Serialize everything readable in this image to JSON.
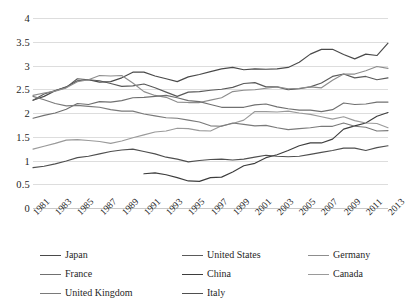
{
  "chart_data": {
    "type": "line",
    "title": "",
    "subtitle": "",
    "xlabel": "",
    "ylabel": "",
    "ylim": [
      0,
      4
    ],
    "yticks": [
      0,
      0.5,
      1,
      1.5,
      2,
      2.5,
      3,
      3.5,
      4
    ],
    "ytick_labels": [
      "0",
      "0.5",
      "1",
      "1.5",
      "2",
      "2.5",
      "3",
      "3.5",
      "4"
    ],
    "grid": true,
    "legend_position": "bottom",
    "x": [
      1981,
      1982,
      1983,
      1984,
      1985,
      1986,
      1987,
      1988,
      1989,
      1990,
      1991,
      1992,
      1993,
      1994,
      1995,
      1996,
      1997,
      1998,
      1999,
      2000,
      2001,
      2002,
      2003,
      2004,
      2005,
      2006,
      2007,
      2008,
      2009,
      2010,
      2011,
      2012,
      2013
    ],
    "xtick_labels": [
      "1981",
      "1983",
      "1985",
      "1987",
      "1989",
      "1991",
      "1993",
      "1995",
      "1997",
      "1999",
      "2001",
      "2003",
      "2005",
      "2007",
      "2009",
      "2011",
      "2013"
    ],
    "series": [
      {
        "name": "Japan",
        "color": "#4a4a4a",
        "values": [
          2.27,
          2.35,
          2.47,
          2.55,
          2.68,
          2.7,
          2.65,
          2.66,
          2.74,
          2.86,
          2.86,
          2.78,
          2.72,
          2.66,
          2.76,
          2.81,
          2.87,
          2.93,
          2.96,
          2.91,
          2.93,
          2.92,
          2.93,
          2.96,
          3.07,
          3.24,
          3.34,
          3.34,
          3.23,
          3.14,
          3.24,
          3.21,
          3.47
        ]
      },
      {
        "name": "United States",
        "color": "#5a5a5a",
        "values": [
          2.27,
          2.4,
          2.47,
          2.54,
          2.72,
          2.7,
          2.68,
          2.62,
          2.56,
          2.57,
          2.61,
          2.53,
          2.44,
          2.35,
          2.44,
          2.45,
          2.48,
          2.5,
          2.54,
          2.62,
          2.64,
          2.55,
          2.55,
          2.49,
          2.51,
          2.55,
          2.63,
          2.77,
          2.82,
          2.74,
          2.77,
          2.7,
          2.74
        ]
      },
      {
        "name": "Germany",
        "color": "#8d8d8d",
        "values": [
          2.37,
          2.42,
          2.46,
          2.53,
          2.66,
          2.7,
          2.79,
          2.78,
          2.79,
          2.63,
          2.45,
          2.37,
          2.33,
          2.23,
          2.22,
          2.22,
          2.27,
          2.32,
          2.45,
          2.48,
          2.49,
          2.52,
          2.55,
          2.51,
          2.52,
          2.55,
          2.53,
          2.69,
          2.82,
          2.82,
          2.89,
          2.98,
          2.94
        ]
      },
      {
        "name": "France",
        "color": "#707070",
        "values": [
          1.89,
          1.95,
          2.0,
          2.08,
          2.2,
          2.18,
          2.24,
          2.23,
          2.26,
          2.32,
          2.33,
          2.35,
          2.37,
          2.32,
          2.26,
          2.24,
          2.18,
          2.12,
          2.12,
          2.12,
          2.17,
          2.19,
          2.13,
          2.09,
          2.06,
          2.06,
          2.03,
          2.07,
          2.21,
          2.18,
          2.19,
          2.23,
          2.23
        ]
      },
      {
        "name": "China",
        "color": "#3d3d3d",
        "values": [
          null,
          null,
          null,
          null,
          null,
          null,
          null,
          null,
          null,
          null,
          0.72,
          0.74,
          0.7,
          0.64,
          0.57,
          0.56,
          0.64,
          0.65,
          0.76,
          0.89,
          0.94,
          1.06,
          1.12,
          1.21,
          1.31,
          1.37,
          1.37,
          1.45,
          1.66,
          1.73,
          1.79,
          1.93,
          2.01
        ]
      },
      {
        "name": "Canada",
        "color": "#9a9a9a",
        "values": [
          1.24,
          1.3,
          1.36,
          1.43,
          1.44,
          1.42,
          1.4,
          1.36,
          1.41,
          1.48,
          1.54,
          1.6,
          1.62,
          1.68,
          1.67,
          1.63,
          1.62,
          1.73,
          1.78,
          1.85,
          2.03,
          2.03,
          2.02,
          2.04,
          2.0,
          1.97,
          1.92,
          1.87,
          1.92,
          1.84,
          1.79,
          1.78,
          1.69
        ]
      },
      {
        "name": "United Kingdom",
        "color": "#7a7a7a",
        "values": [
          2.35,
          2.28,
          2.2,
          2.15,
          2.16,
          2.14,
          2.12,
          2.07,
          2.04,
          2.04,
          1.98,
          1.94,
          1.9,
          1.89,
          1.85,
          1.81,
          1.73,
          1.72,
          1.79,
          1.76,
          1.73,
          1.74,
          1.69,
          1.65,
          1.67,
          1.69,
          1.72,
          1.72,
          1.79,
          1.72,
          1.7,
          1.62,
          1.63
        ]
      },
      {
        "name": "Italy",
        "color": "#4f4f4f",
        "values": [
          0.85,
          0.88,
          0.93,
          0.99,
          1.06,
          1.09,
          1.14,
          1.19,
          1.22,
          1.24,
          1.19,
          1.14,
          1.07,
          1.03,
          0.97,
          1.0,
          1.02,
          1.03,
          1.01,
          1.03,
          1.07,
          1.11,
          1.09,
          1.08,
          1.09,
          1.13,
          1.17,
          1.21,
          1.26,
          1.26,
          1.21,
          1.27,
          1.31
        ]
      }
    ]
  },
  "legend": {
    "items": [
      {
        "label": "Japan"
      },
      {
        "label": "United States"
      },
      {
        "label": "Germany"
      },
      {
        "label": "France"
      },
      {
        "label": "China"
      },
      {
        "label": "Canada"
      },
      {
        "label": "United Kingdom"
      },
      {
        "label": "Italy"
      }
    ]
  }
}
